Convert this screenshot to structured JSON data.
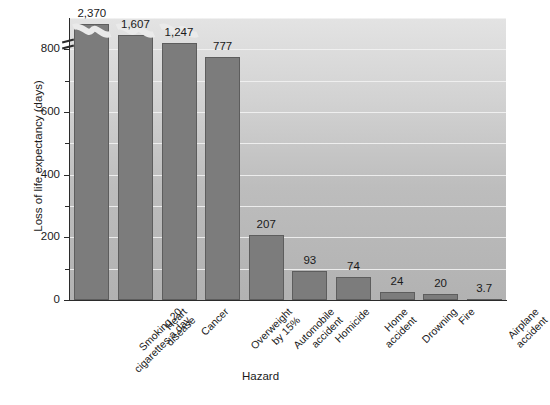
{
  "chart_data": {
    "type": "bar",
    "title": "",
    "xlabel": "Hazard",
    "ylabel": "Loss of life expectancy (days)",
    "categories": [
      "Smoking 20\ncigarettes a day",
      "Heart\ndisease",
      "Cancer",
      "Overweight\nby 15%",
      "Automobile\naccident",
      "Homicide",
      "Home\naccident",
      "Drowning",
      "Fire",
      "Airplane\naccident"
    ],
    "values": [
      2370,
      1607,
      1247,
      777,
      207,
      93,
      74,
      24,
      20,
      3.7
    ],
    "value_labels": [
      "2,370",
      "1,607",
      "1,247",
      "777",
      "207",
      "93",
      "74",
      "24",
      "20",
      "3.7"
    ],
    "ylim": [
      0,
      900
    ],
    "axis_break": true,
    "axis_break_note": "y-axis is broken above 800; bars for 2,370 / 1,607 / 1,247 are truncated",
    "ytick_labels": [
      "0",
      "200",
      "400",
      "600",
      "800"
    ],
    "ytick_values": [
      0,
      200,
      400,
      600,
      800
    ],
    "yminor_ticks": [
      100,
      300,
      500,
      700
    ],
    "grid": true,
    "grid_axis": "y",
    "grid_color": "#f2f2f2",
    "legend": "none",
    "bar_color": "#7c7c7c",
    "bar_edge_color": "#5d5d5d",
    "plot_background": "#cfcfcf"
  }
}
